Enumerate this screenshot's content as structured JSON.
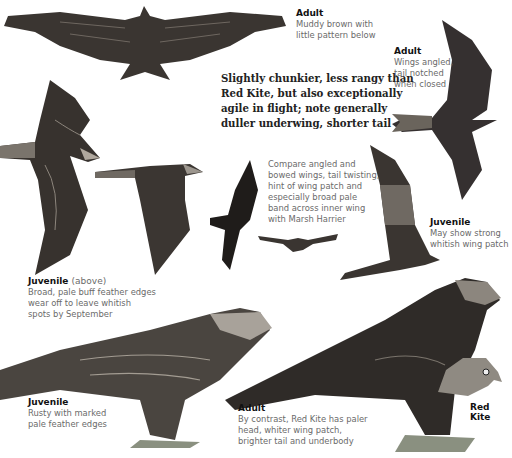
{
  "summary": {
    "lines": [
      "Slightly chunkier, less rangy than",
      "Red Kite, but also exceptionally",
      "agile in flight; note generally",
      "duller underwing, shorter tail"
    ]
  },
  "captions": {
    "adult_top": {
      "heading": "Adult",
      "lines": [
        "Muddy brown with",
        "little pattern below"
      ]
    },
    "adult_right": {
      "heading": "Adult",
      "lines": [
        "Wings angled,",
        "tail notched",
        "when closed"
      ]
    },
    "compare": {
      "lines": [
        "Compare angled and",
        "bowed wings, tail twisting,",
        "hint of wing patch and",
        "especially broad pale",
        "band across inner wing",
        "with Marsh Harrier"
      ]
    },
    "juvenile_right": {
      "heading": "Juvenile",
      "lines": [
        "May show strong",
        "whitish wing patch"
      ]
    },
    "juvenile_above": {
      "heading": "Juvenile",
      "sub": "(above)",
      "lines": [
        "Broad, pale buff feather edges",
        "wear off to leave whitish",
        "spots by September"
      ]
    },
    "juvenile_perched": {
      "heading": "Juvenile",
      "lines": [
        "Rusty with marked",
        "pale feather edges"
      ]
    },
    "adult_perched": {
      "heading": "Adult",
      "lines": [
        "By contrast, Red Kite has paler",
        "head, whiter wing patch,",
        "brighter tail and underbody"
      ]
    }
  },
  "red_kite_label": "Red Kite",
  "colors": {
    "plumage_dark": "#2f2b28",
    "plumage_mid": "#5a5550",
    "plumage_light": "#9a948c",
    "text_body": "#6a6a6a",
    "text_heading": "#111111"
  }
}
